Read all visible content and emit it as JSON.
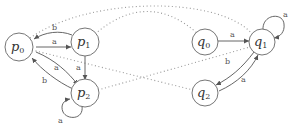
{
  "diagram": {
    "type": "automata-pair-correspondence",
    "automaton_p": {
      "states": [
        {
          "id": "p0",
          "base": "p",
          "sub": "0"
        },
        {
          "id": "p1",
          "base": "p",
          "sub": "1"
        },
        {
          "id": "p2",
          "base": "p",
          "sub": "2"
        }
      ],
      "transitions": [
        {
          "from": "p1",
          "to": "p0",
          "label": "b"
        },
        {
          "from": "p0",
          "to": "p1",
          "label": "a"
        },
        {
          "from": "p0",
          "to": "p2",
          "label": "a"
        },
        {
          "from": "p1",
          "to": "p2",
          "label": "a"
        },
        {
          "from": "p2",
          "to": "p0",
          "label": "b"
        },
        {
          "from": "p2",
          "to": "p2",
          "label": "a"
        }
      ]
    },
    "automaton_q": {
      "states": [
        {
          "id": "q0",
          "base": "q",
          "sub": "0"
        },
        {
          "id": "q1",
          "base": "q",
          "sub": "1"
        },
        {
          "id": "q2",
          "base": "q",
          "sub": "2"
        }
      ],
      "transitions": [
        {
          "from": "q0",
          "to": "q1",
          "label": "a"
        },
        {
          "from": "q1",
          "to": "q1",
          "label": "a"
        },
        {
          "from": "q1",
          "to": "q2",
          "label": "b"
        },
        {
          "from": "q2",
          "to": "q1",
          "label": "a"
        }
      ]
    },
    "relation_links": [
      {
        "a": "p0",
        "b": "q1"
      },
      {
        "a": "p1",
        "b": "q0"
      },
      {
        "a": "p0",
        "b": "q2"
      },
      {
        "a": "p2",
        "b": "q1"
      }
    ],
    "labels": {
      "p0_base": "p",
      "p0_sub": "0",
      "p1_base": "p",
      "p1_sub": "1",
      "p2_base": "p",
      "p2_sub": "2",
      "q0_base": "q",
      "q0_sub": "0",
      "q1_base": "q",
      "q1_sub": "1",
      "q2_base": "q",
      "q2_sub": "2",
      "e_p1_p0": "b",
      "e_p0_p1": "a",
      "e_p0_p2": "a",
      "e_p1_p2": "a",
      "e_p2_p0": "b",
      "e_p2_loop": "a",
      "e_q0_q1": "a",
      "e_q1_loop": "a",
      "e_q1_q2": "b",
      "e_q2_q1": "a"
    },
    "colors": {
      "node_stroke": "#666666",
      "edge": "#555555",
      "dotted_link": "#999999"
    }
  }
}
